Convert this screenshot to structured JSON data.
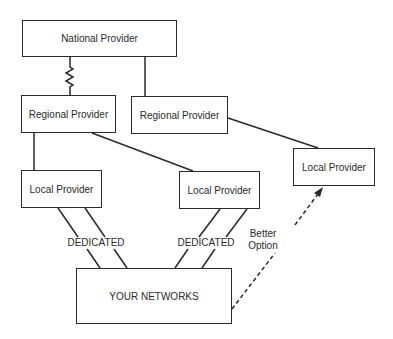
{
  "diagram": {
    "type": "network-topology",
    "nodes": [
      {
        "id": "national",
        "label": "National Provider",
        "x": 22,
        "y": 20,
        "w": 155,
        "h": 37
      },
      {
        "id": "regional1",
        "label": "Regional Provider",
        "x": 21,
        "y": 95,
        "w": 95,
        "h": 38
      },
      {
        "id": "regional2",
        "label": "Regional Provider",
        "x": 131,
        "y": 96,
        "w": 97,
        "h": 38
      },
      {
        "id": "local1",
        "label": "Local Provider",
        "x": 21,
        "y": 170,
        "w": 81,
        "h": 38
      },
      {
        "id": "local2",
        "label": "Local Provider",
        "x": 179,
        "y": 171,
        "w": 81,
        "h": 38
      },
      {
        "id": "local3",
        "label": "Local Provider",
        "x": 293,
        "y": 148,
        "w": 82,
        "h": 38
      },
      {
        "id": "yours",
        "label": "YOUR NETWORKS",
        "x": 76,
        "y": 268,
        "w": 156,
        "h": 56
      }
    ],
    "edges": [
      {
        "from": "national",
        "to": "regional1",
        "style": "zigzag"
      },
      {
        "from": "national",
        "to": "regional2",
        "style": "solid"
      },
      {
        "from": "regional1",
        "to": "local1",
        "style": "solid"
      },
      {
        "from": "regional1",
        "to": "local2",
        "style": "solid"
      },
      {
        "from": "regional2",
        "to": "local3",
        "style": "solid"
      },
      {
        "from": "local1",
        "to": "yours",
        "style": "double",
        "label": "DEDICATED"
      },
      {
        "from": "local2",
        "to": "yours",
        "style": "double",
        "label": "DEDICATED"
      },
      {
        "from": "yours",
        "to": "local3",
        "style": "dashed-arrow",
        "label": "Better Option"
      }
    ],
    "labels": {
      "dedicated_left": "DEDICATED",
      "dedicated_right": "DEDICATED",
      "better_option_line1": "Better",
      "better_option_line2": "Option"
    },
    "colors": {
      "stroke": "#2a2a2a",
      "background": "#ffffff"
    }
  }
}
